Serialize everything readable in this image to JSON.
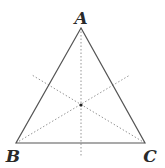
{
  "diagram": {
    "vertices": [
      {
        "label": "A",
        "x": 81,
        "y": 28,
        "label_x": 81,
        "label_y": 24
      },
      {
        "label": "B",
        "x": 16,
        "y": 143,
        "label_x": 13,
        "label_y": 162
      },
      {
        "label": "C",
        "x": 145,
        "y": 143,
        "label_x": 150,
        "label_y": 162
      }
    ],
    "centroid": {
      "x": 81,
      "y": 105
    },
    "dotted_lines": [
      {
        "name": "from-A",
        "x1": 81,
        "y1": 28,
        "x2": 81,
        "y2": 157
      },
      {
        "name": "from-B",
        "x1": 16,
        "y1": 143,
        "x2": 130,
        "y2": 75
      },
      {
        "name": "from-C",
        "x1": 145,
        "y1": 143,
        "x2": 32,
        "y2": 75
      }
    ],
    "colors": {
      "sides": "#555555",
      "dotted": "#8a8a8a",
      "labels": "#2a2a2a",
      "background": "#ffffff"
    }
  }
}
